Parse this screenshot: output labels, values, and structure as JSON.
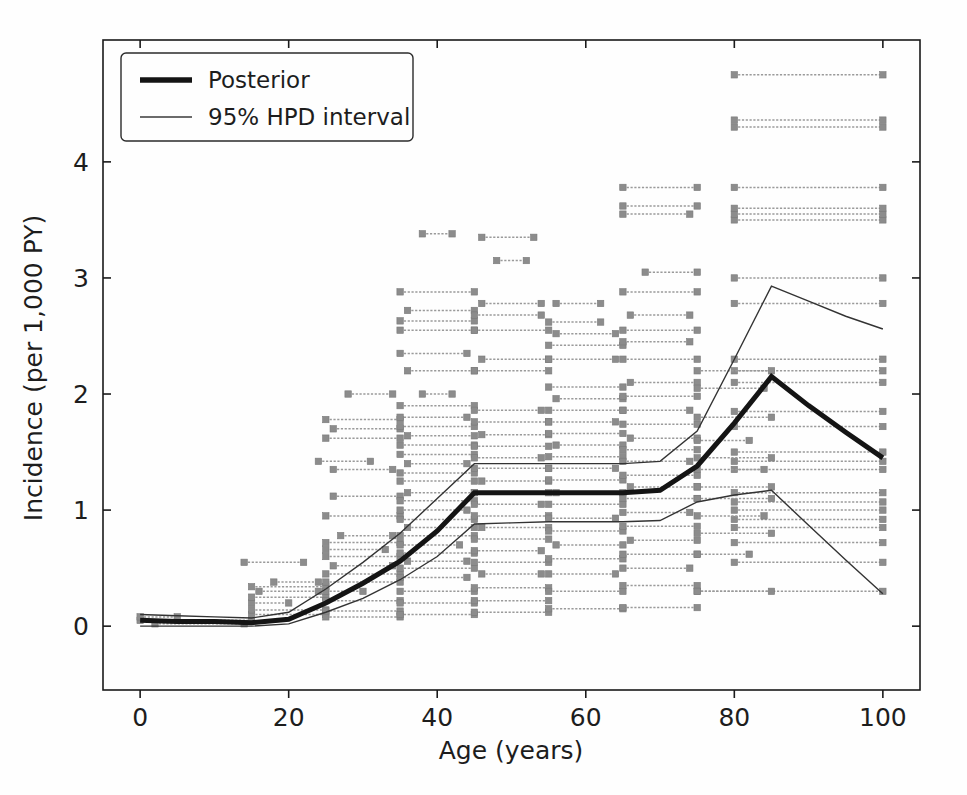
{
  "figure": {
    "background": "#fefefe",
    "foreground": "#1a1a1a"
  },
  "chart_data": {
    "type": "line",
    "title": "",
    "xlabel": "Age (years)",
    "ylabel": "Incidence (per 1,000 PY)",
    "xlim": [
      -5,
      105
    ],
    "ylim": [
      -0.55,
      5.05
    ],
    "xticks": [
      0,
      20,
      40,
      60,
      80,
      100
    ],
    "yticks": [
      0,
      1,
      2,
      3,
      4
    ],
    "xtick_labels": [
      "0",
      "20",
      "40",
      "60",
      "80",
      "100"
    ],
    "ytick_labels": [
      "0",
      "1",
      "2",
      "3",
      "4"
    ],
    "grid": false,
    "legend_position": "upper left",
    "legend": [
      {
        "label": "Posterior",
        "style": "thick-line",
        "color": "#141414",
        "width": 5
      },
      {
        "label": "95% HPD interval",
        "style": "thin-line",
        "color": "#333333",
        "width": 1.4
      }
    ],
    "series": [
      {
        "name": "Posterior",
        "color": "#141414",
        "linewidth": 5,
        "x": [
          0,
          5,
          10,
          15,
          20,
          25,
          30,
          35,
          40,
          45,
          50,
          55,
          60,
          65,
          70,
          75,
          80,
          85,
          90,
          95,
          100
        ],
        "values": [
          0.05,
          0.04,
          0.04,
          0.03,
          0.06,
          0.2,
          0.37,
          0.56,
          0.82,
          1.15,
          1.15,
          1.15,
          1.15,
          1.15,
          1.17,
          1.38,
          1.75,
          2.15,
          1.9,
          1.67,
          1.45
        ]
      },
      {
        "name": "95% HPD upper",
        "color": "#333333",
        "linewidth": 1.4,
        "x": [
          0,
          5,
          10,
          15,
          20,
          25,
          30,
          35,
          40,
          45,
          50,
          55,
          60,
          65,
          70,
          75,
          80,
          85,
          90,
          95,
          100
        ],
        "values": [
          0.1,
          0.09,
          0.08,
          0.07,
          0.12,
          0.32,
          0.55,
          0.8,
          1.1,
          1.4,
          1.4,
          1.4,
          1.4,
          1.4,
          1.42,
          1.68,
          2.3,
          2.93,
          2.8,
          2.67,
          2.56
        ]
      },
      {
        "name": "95% HPD lower",
        "color": "#333333",
        "linewidth": 1.4,
        "x": [
          0,
          5,
          10,
          15,
          20,
          25,
          30,
          35,
          40,
          45,
          50,
          55,
          60,
          65,
          70,
          75,
          80,
          85,
          90,
          95,
          100
        ],
        "values": [
          0.0,
          0.0,
          0.0,
          0.0,
          0.02,
          0.12,
          0.24,
          0.4,
          0.6,
          0.88,
          0.89,
          0.9,
          0.9,
          0.9,
          0.91,
          1.07,
          1.13,
          1.17,
          0.87,
          0.57,
          0.28
        ]
      }
    ],
    "observations_note": "grey horizontal interval bars with square end markers = input study data (age range vs incidence)",
    "observations": [
      {
        "x0": 0,
        "x1": 15,
        "y": 0.05
      },
      {
        "x0": 0,
        "x1": 5,
        "y": 0.08
      },
      {
        "x0": 2,
        "x1": 14,
        "y": 0.02
      },
      {
        "x0": 15,
        "x1": 25,
        "y": 0.1
      },
      {
        "x0": 15,
        "x1": 25,
        "y": 0.14
      },
      {
        "x0": 15,
        "x1": 20,
        "y": 0.2
      },
      {
        "x0": 15,
        "x1": 25,
        "y": 0.25
      },
      {
        "x0": 16,
        "x1": 24,
        "y": 0.3
      },
      {
        "x0": 15,
        "x1": 25,
        "y": 0.34
      },
      {
        "x0": 18,
        "x1": 24,
        "y": 0.38
      },
      {
        "x0": 14,
        "x1": 22,
        "y": 0.55
      },
      {
        "x0": 25,
        "x1": 35,
        "y": 0.08
      },
      {
        "x0": 25,
        "x1": 35,
        "y": 0.13
      },
      {
        "x0": 25,
        "x1": 35,
        "y": 0.22
      },
      {
        "x0": 25,
        "x1": 30,
        "y": 0.3
      },
      {
        "x0": 25,
        "x1": 35,
        "y": 0.38
      },
      {
        "x0": 25,
        "x1": 35,
        "y": 0.45
      },
      {
        "x0": 26,
        "x1": 34,
        "y": 0.52
      },
      {
        "x0": 25,
        "x1": 35,
        "y": 0.6
      },
      {
        "x0": 25,
        "x1": 33,
        "y": 0.66
      },
      {
        "x0": 25,
        "x1": 35,
        "y": 0.72
      },
      {
        "x0": 27,
        "x1": 34,
        "y": 0.78
      },
      {
        "x0": 25,
        "x1": 35,
        "y": 0.95
      },
      {
        "x0": 26,
        "x1": 35,
        "y": 1.12
      },
      {
        "x0": 26,
        "x1": 34,
        "y": 1.35
      },
      {
        "x0": 25,
        "x1": 35,
        "y": 1.62
      },
      {
        "x0": 26,
        "x1": 35,
        "y": 1.7
      },
      {
        "x0": 25,
        "x1": 35,
        "y": 1.78
      },
      {
        "x0": 24,
        "x1": 31,
        "y": 1.42
      },
      {
        "x0": 28,
        "x1": 34,
        "y": 2.0
      },
      {
        "x0": 35,
        "x1": 45,
        "y": 0.1
      },
      {
        "x0": 35,
        "x1": 45,
        "y": 0.2
      },
      {
        "x0": 35,
        "x1": 45,
        "y": 0.3
      },
      {
        "x0": 35,
        "x1": 44,
        "y": 0.42
      },
      {
        "x0": 35,
        "x1": 45,
        "y": 0.5
      },
      {
        "x0": 36,
        "x1": 44,
        "y": 0.56
      },
      {
        "x0": 35,
        "x1": 45,
        "y": 0.63
      },
      {
        "x0": 35,
        "x1": 43,
        "y": 0.7
      },
      {
        "x0": 35,
        "x1": 45,
        "y": 0.78
      },
      {
        "x0": 36,
        "x1": 45,
        "y": 0.85
      },
      {
        "x0": 35,
        "x1": 45,
        "y": 0.92
      },
      {
        "x0": 35,
        "x1": 44,
        "y": 1.0
      },
      {
        "x0": 35,
        "x1": 45,
        "y": 1.08
      },
      {
        "x0": 36,
        "x1": 45,
        "y": 1.15
      },
      {
        "x0": 35,
        "x1": 45,
        "y": 1.25
      },
      {
        "x0": 35,
        "x1": 45,
        "y": 1.32
      },
      {
        "x0": 36,
        "x1": 44,
        "y": 1.4
      },
      {
        "x0": 35,
        "x1": 45,
        "y": 1.48
      },
      {
        "x0": 35,
        "x1": 45,
        "y": 1.56
      },
      {
        "x0": 36,
        "x1": 45,
        "y": 1.64
      },
      {
        "x0": 35,
        "x1": 45,
        "y": 1.72
      },
      {
        "x0": 35,
        "x1": 44,
        "y": 1.8
      },
      {
        "x0": 35,
        "x1": 45,
        "y": 1.9
      },
      {
        "x0": 36,
        "x1": 45,
        "y": 2.2
      },
      {
        "x0": 35,
        "x1": 44,
        "y": 2.35
      },
      {
        "x0": 35,
        "x1": 45,
        "y": 2.55
      },
      {
        "x0": 35,
        "x1": 45,
        "y": 2.63
      },
      {
        "x0": 36,
        "x1": 45,
        "y": 2.72
      },
      {
        "x0": 35,
        "x1": 45,
        "y": 2.88
      },
      {
        "x0": 38,
        "x1": 42,
        "y": 3.38
      },
      {
        "x0": 38,
        "x1": 42,
        "y": 2.0
      },
      {
        "x0": 45,
        "x1": 55,
        "y": 0.12
      },
      {
        "x0": 45,
        "x1": 55,
        "y": 0.22
      },
      {
        "x0": 45,
        "x1": 55,
        "y": 0.33
      },
      {
        "x0": 46,
        "x1": 54,
        "y": 0.45
      },
      {
        "x0": 45,
        "x1": 55,
        "y": 0.55
      },
      {
        "x0": 45,
        "x1": 54,
        "y": 0.65
      },
      {
        "x0": 45,
        "x1": 55,
        "y": 0.75
      },
      {
        "x0": 46,
        "x1": 55,
        "y": 0.85
      },
      {
        "x0": 45,
        "x1": 55,
        "y": 0.95
      },
      {
        "x0": 45,
        "x1": 54,
        "y": 1.05
      },
      {
        "x0": 45,
        "x1": 55,
        "y": 1.15
      },
      {
        "x0": 46,
        "x1": 55,
        "y": 1.25
      },
      {
        "x0": 45,
        "x1": 55,
        "y": 1.36
      },
      {
        "x0": 45,
        "x1": 54,
        "y": 1.45
      },
      {
        "x0": 45,
        "x1": 55,
        "y": 1.55
      },
      {
        "x0": 46,
        "x1": 55,
        "y": 1.65
      },
      {
        "x0": 45,
        "x1": 55,
        "y": 1.76
      },
      {
        "x0": 45,
        "x1": 54,
        "y": 1.86
      },
      {
        "x0": 45,
        "x1": 55,
        "y": 2.2
      },
      {
        "x0": 46,
        "x1": 55,
        "y": 2.3
      },
      {
        "x0": 45,
        "x1": 55,
        "y": 2.55
      },
      {
        "x0": 45,
        "x1": 54,
        "y": 2.68
      },
      {
        "x0": 46,
        "x1": 54,
        "y": 2.78
      },
      {
        "x0": 48,
        "x1": 52,
        "y": 3.15
      },
      {
        "x0": 46,
        "x1": 53,
        "y": 3.35
      },
      {
        "x0": 55,
        "x1": 65,
        "y": 0.15
      },
      {
        "x0": 55,
        "x1": 65,
        "y": 0.3
      },
      {
        "x0": 55,
        "x1": 64,
        "y": 0.45
      },
      {
        "x0": 55,
        "x1": 65,
        "y": 0.58
      },
      {
        "x0": 56,
        "x1": 65,
        "y": 0.7
      },
      {
        "x0": 55,
        "x1": 65,
        "y": 0.82
      },
      {
        "x0": 55,
        "x1": 64,
        "y": 0.93
      },
      {
        "x0": 55,
        "x1": 65,
        "y": 1.05
      },
      {
        "x0": 56,
        "x1": 65,
        "y": 1.15
      },
      {
        "x0": 55,
        "x1": 65,
        "y": 1.26
      },
      {
        "x0": 55,
        "x1": 64,
        "y": 1.36
      },
      {
        "x0": 55,
        "x1": 65,
        "y": 1.46
      },
      {
        "x0": 56,
        "x1": 65,
        "y": 1.56
      },
      {
        "x0": 55,
        "x1": 65,
        "y": 1.66
      },
      {
        "x0": 55,
        "x1": 64,
        "y": 1.76
      },
      {
        "x0": 55,
        "x1": 65,
        "y": 1.86
      },
      {
        "x0": 56,
        "x1": 65,
        "y": 1.96
      },
      {
        "x0": 55,
        "x1": 65,
        "y": 2.06
      },
      {
        "x0": 55,
        "x1": 64,
        "y": 2.3
      },
      {
        "x0": 55,
        "x1": 65,
        "y": 2.42
      },
      {
        "x0": 56,
        "x1": 64,
        "y": 2.52
      },
      {
        "x0": 55,
        "x1": 62,
        "y": 2.62
      },
      {
        "x0": 56,
        "x1": 62,
        "y": 2.78
      },
      {
        "x0": 65,
        "x1": 75,
        "y": 0.16
      },
      {
        "x0": 65,
        "x1": 75,
        "y": 0.35
      },
      {
        "x0": 65,
        "x1": 74,
        "y": 0.5
      },
      {
        "x0": 65,
        "x1": 75,
        "y": 0.62
      },
      {
        "x0": 66,
        "x1": 75,
        "y": 0.74
      },
      {
        "x0": 65,
        "x1": 75,
        "y": 0.86
      },
      {
        "x0": 65,
        "x1": 74,
        "y": 0.98
      },
      {
        "x0": 65,
        "x1": 75,
        "y": 1.1
      },
      {
        "x0": 66,
        "x1": 75,
        "y": 1.2
      },
      {
        "x0": 65,
        "x1": 75,
        "y": 1.3
      },
      {
        "x0": 65,
        "x1": 74,
        "y": 1.42
      },
      {
        "x0": 65,
        "x1": 75,
        "y": 1.52
      },
      {
        "x0": 66,
        "x1": 75,
        "y": 1.62
      },
      {
        "x0": 65,
        "x1": 75,
        "y": 1.74
      },
      {
        "x0": 65,
        "x1": 74,
        "y": 1.86
      },
      {
        "x0": 65,
        "x1": 75,
        "y": 1.98
      },
      {
        "x0": 66,
        "x1": 75,
        "y": 2.1
      },
      {
        "x0": 65,
        "x1": 75,
        "y": 2.3
      },
      {
        "x0": 65,
        "x1": 74,
        "y": 2.45
      },
      {
        "x0": 65,
        "x1": 75,
        "y": 2.55
      },
      {
        "x0": 66,
        "x1": 74,
        "y": 2.68
      },
      {
        "x0": 65,
        "x1": 75,
        "y": 2.88
      },
      {
        "x0": 68,
        "x1": 75,
        "y": 3.05
      },
      {
        "x0": 65,
        "x1": 74,
        "y": 3.55
      },
      {
        "x0": 65,
        "x1": 75,
        "y": 3.62
      },
      {
        "x0": 65,
        "x1": 75,
        "y": 3.78
      },
      {
        "x0": 75,
        "x1": 100,
        "y": 0.3
      },
      {
        "x0": 80,
        "x1": 100,
        "y": 0.55
      },
      {
        "x0": 80,
        "x1": 100,
        "y": 0.72
      },
      {
        "x0": 80,
        "x1": 100,
        "y": 0.85
      },
      {
        "x0": 80,
        "x1": 100,
        "y": 0.92
      },
      {
        "x0": 80,
        "x1": 100,
        "y": 1.0
      },
      {
        "x0": 80,
        "x1": 100,
        "y": 1.07
      },
      {
        "x0": 80,
        "x1": 100,
        "y": 1.15
      },
      {
        "x0": 80,
        "x1": 100,
        "y": 1.35
      },
      {
        "x0": 80,
        "x1": 100,
        "y": 1.42
      },
      {
        "x0": 80,
        "x1": 100,
        "y": 1.5
      },
      {
        "x0": 80,
        "x1": 100,
        "y": 1.72
      },
      {
        "x0": 80,
        "x1": 100,
        "y": 1.85
      },
      {
        "x0": 80,
        "x1": 100,
        "y": 2.1
      },
      {
        "x0": 80,
        "x1": 100,
        "y": 2.2
      },
      {
        "x0": 80,
        "x1": 100,
        "y": 2.3
      },
      {
        "x0": 80,
        "x1": 100,
        "y": 2.78
      },
      {
        "x0": 80,
        "x1": 100,
        "y": 3.0
      },
      {
        "x0": 80,
        "x1": 100,
        "y": 3.5
      },
      {
        "x0": 80,
        "x1": 100,
        "y": 3.55
      },
      {
        "x0": 80,
        "x1": 100,
        "y": 3.6
      },
      {
        "x0": 80,
        "x1": 100,
        "y": 3.78
      },
      {
        "x0": 80,
        "x1": 100,
        "y": 4.3
      },
      {
        "x0": 80,
        "x1": 100,
        "y": 4.36
      },
      {
        "x0": 80,
        "x1": 100,
        "y": 4.75
      },
      {
        "x0": 75,
        "x1": 85,
        "y": 0.3
      },
      {
        "x0": 75,
        "x1": 82,
        "y": 0.62
      },
      {
        "x0": 75,
        "x1": 85,
        "y": 0.8
      },
      {
        "x0": 75,
        "x1": 84,
        "y": 0.95
      },
      {
        "x0": 75,
        "x1": 85,
        "y": 1.1
      },
      {
        "x0": 75,
        "x1": 85,
        "y": 1.2
      },
      {
        "x0": 75,
        "x1": 84,
        "y": 1.35
      },
      {
        "x0": 75,
        "x1": 85,
        "y": 1.45
      },
      {
        "x0": 75,
        "x1": 82,
        "y": 1.6
      },
      {
        "x0": 75,
        "x1": 85,
        "y": 1.8
      },
      {
        "x0": 75,
        "x1": 84,
        "y": 2.05
      },
      {
        "x0": 75,
        "x1": 85,
        "y": 2.2
      }
    ]
  }
}
